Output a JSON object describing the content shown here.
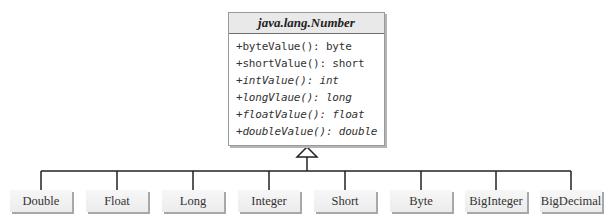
{
  "superclass": {
    "name": "java.lang.Number",
    "methods": [
      {
        "text": "+byteValue(): byte",
        "italic": false
      },
      {
        "text": "+shortValue(): short",
        "italic": false
      },
      {
        "text": "+intValue(): int",
        "italic": true
      },
      {
        "text": "+longVlaue(): long",
        "italic": true
      },
      {
        "text": "+floatValue(): float",
        "italic": true
      },
      {
        "text": "+doubleValue(): double",
        "italic": true
      }
    ]
  },
  "subclasses": [
    {
      "name": "Double",
      "x": 10
    },
    {
      "name": "Float",
      "x": 86
    },
    {
      "name": "Long",
      "x": 162
    },
    {
      "name": "Integer",
      "x": 238
    },
    {
      "name": "Short",
      "x": 314
    },
    {
      "name": "Byte",
      "x": 390
    },
    {
      "name": "BigInteger",
      "x": 465
    },
    {
      "name": "BigDecimal",
      "x": 540
    }
  ],
  "relationship": "inheritance-arrow"
}
